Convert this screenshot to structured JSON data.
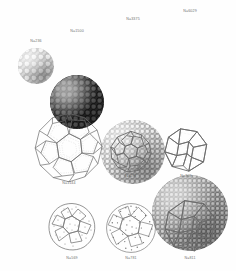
{
  "figure": {
    "name": "cluster-structure-figure",
    "background_color": "#fefefe",
    "ink_color": "#5a5a5a",
    "rows": [
      {
        "row_name": "space-filling-sphere-packings",
        "items": [
          {
            "label": "N=236",
            "cx": 36,
            "cy": 66,
            "d": 36,
            "style": "g-a base-a",
            "label_y": 39
          },
          {
            "label": "N=1500",
            "cx": 77,
            "cy": 66,
            "d": 54,
            "style": "g-b base-b",
            "label_y": 29
          },
          {
            "label": "N=3375",
            "cx": 133,
            "cy": 62,
            "d": 64,
            "style": "g-c base-c",
            "label_y": 17
          },
          {
            "label": "N=6029",
            "cx": 190,
            "cy": 59,
            "d": 76,
            "style": "g-d base-d",
            "label_y": 9
          }
        ]
      },
      {
        "row_name": "wireframe-polyhedra",
        "items": [
          {
            "label": "N=1144",
            "cx": 69,
            "cy": 148,
            "d": 70,
            "label_y": 181,
            "kind": "truncated-polyhedron-large"
          },
          {
            "label": "N=297",
            "cx": 131,
            "cy": 152,
            "d": 42,
            "label_y": 174,
            "kind": "truncated-polyhedron-small"
          },
          {
            "label": "N=309",
            "cx": 186,
            "cy": 150,
            "d": 44,
            "label_y": 174,
            "kind": "icosahedron"
          }
        ]
      },
      {
        "row_name": "dotted-facet-polyhedra",
        "items": [
          {
            "label": "N=569",
            "cx": 72,
            "cy": 227,
            "d": 48,
            "label_y": 256,
            "kind": "rough-sphere"
          },
          {
            "label": "N=781",
            "cx": 131,
            "cy": 228,
            "d": 50,
            "label_y": 256,
            "kind": "rough-sphere-dense"
          },
          {
            "label": "N=811",
            "cx": 190,
            "cy": 226,
            "d": 52,
            "label_y": 256,
            "kind": "faceted-icosahedron"
          }
        ]
      }
    ]
  }
}
